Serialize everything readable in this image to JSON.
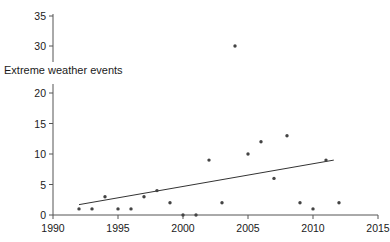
{
  "chart_data": {
    "type": "scatter",
    "title": "",
    "subtitle": "",
    "xlabel": "",
    "ylabel": "Extreme weather events",
    "xlim": [
      1990,
      2015
    ],
    "ylim": [
      0,
      35
    ],
    "grid": false,
    "legend": null,
    "y_axis_break": {
      "present": true,
      "lower_range": [
        0,
        22
      ],
      "upper_range": [
        28,
        35
      ],
      "note": "Y axis is drawn in two segments with the axis title placed in the gap"
    },
    "xticks": [
      1990,
      1995,
      2000,
      2005,
      2010,
      2015
    ],
    "xtick_labels": [
      "1990",
      "1995",
      "2000",
      "2005",
      "2010",
      "2015"
    ],
    "yticks": [
      0,
      5,
      10,
      15,
      20,
      30,
      35
    ],
    "ytick_labels": [
      "0",
      "5",
      "10",
      "15",
      "20",
      "30",
      "35"
    ],
    "x": [
      1992,
      1993,
      1994,
      1995,
      1996,
      1997,
      1998,
      1999,
      2000,
      2001,
      2002,
      2003,
      2004,
      2005,
      2006,
      2007,
      2008,
      2009,
      2010,
      2011,
      2012
    ],
    "values": [
      1,
      1,
      3,
      1,
      1,
      3,
      4,
      2,
      0,
      0,
      9,
      2,
      30,
      10,
      12,
      6,
      13,
      2,
      1,
      9,
      2
    ],
    "series": [
      {
        "name": "Extreme weather events",
        "marker": "dot",
        "color": "#444444",
        "points": [
          {
            "x": 1992,
            "y": 1
          },
          {
            "x": 1993,
            "y": 1
          },
          {
            "x": 1994,
            "y": 3
          },
          {
            "x": 1995,
            "y": 1
          },
          {
            "x": 1996,
            "y": 1
          },
          {
            "x": 1997,
            "y": 3
          },
          {
            "x": 1998,
            "y": 4
          },
          {
            "x": 1999,
            "y": 2
          },
          {
            "x": 2000,
            "y": 0
          },
          {
            "x": 2001,
            "y": 0
          },
          {
            "x": 2002,
            "y": 9
          },
          {
            "x": 2003,
            "y": 2
          },
          {
            "x": 2004,
            "y": 30
          },
          {
            "x": 2005,
            "y": 10
          },
          {
            "x": 2006,
            "y": 12
          },
          {
            "x": 2007,
            "y": 6
          },
          {
            "x": 2008,
            "y": 13
          },
          {
            "x": 2009,
            "y": 2
          },
          {
            "x": 2010,
            "y": 1
          },
          {
            "x": 2011,
            "y": 9
          },
          {
            "x": 2012,
            "y": 2
          }
        ]
      }
    ],
    "trendline": {
      "type": "linear",
      "color": "#333333",
      "x_start": 1992,
      "y_start": 1.7,
      "x_end": 2011.6,
      "y_end": 9.0
    }
  },
  "colors": {
    "axis": "#555555",
    "marker": "#444444",
    "trendline": "#333333",
    "text": "#1a1a1a",
    "background": "#ffffff"
  }
}
